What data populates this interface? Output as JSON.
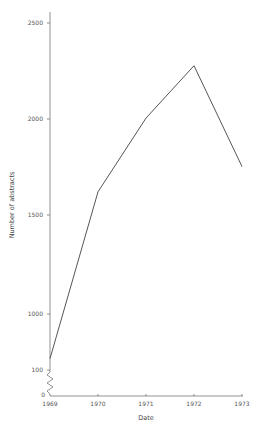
{
  "chart_data": {
    "type": "line",
    "title": "",
    "xlabel": "Date",
    "ylabel": "Number of abstracts",
    "categories": [
      "1969",
      "1970",
      "1971",
      "1972",
      "1973"
    ],
    "series": [
      {
        "name": "Number of abstracts",
        "values": [
          770,
          1630,
          2010,
          2280,
          1760
        ]
      }
    ],
    "y_ticks": [
      0,
      100,
      1000,
      1500,
      2000,
      2500
    ],
    "y_tick_labels": [
      "0",
      "100",
      "1000",
      "1500",
      "2000",
      "2500"
    ],
    "x_tick_labels": [
      "1969",
      "1970",
      "1971",
      "1972",
      "1973"
    ],
    "ylim": [
      0,
      2500
    ],
    "axis_break": "zigzag between 0 and 100 on y-axis",
    "grid": false,
    "legend": "none",
    "line_color": "#555555"
  }
}
